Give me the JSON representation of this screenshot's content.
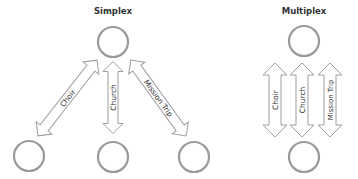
{
  "diagrams": {
    "simplex": {
      "title": "Simplex",
      "arrows": [
        {
          "label": "Choir"
        },
        {
          "label": "Church"
        },
        {
          "label": "Mission Trip"
        }
      ]
    },
    "multiplex": {
      "title": "Multiplex",
      "arrows": [
        {
          "label": "Choir"
        },
        {
          "label": "Church"
        },
        {
          "label": "Mission Trip"
        }
      ]
    }
  },
  "colors": {
    "node_stroke": "#9a9a9a",
    "arrow_stroke": "#9e9e9e",
    "text": "#333333"
  }
}
